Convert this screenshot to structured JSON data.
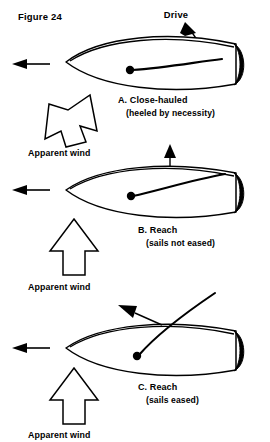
{
  "figure": {
    "caption": "Figure 24",
    "drive_label": "Drive",
    "wind_label": "Apparent wind"
  },
  "colors": {
    "ink": "#000000",
    "paper": "#ffffff",
    "text": "#1a1a1a"
  },
  "panels": [
    {
      "id": "A",
      "title": "A. Close-hauled",
      "subtitle": "(heeled by necessity)",
      "wind_label": "Apparent wind",
      "wind_arrow": "block-arrow-tilted-up-right",
      "force_label": "Drive",
      "travel_arrow": "arrow-left",
      "sail_state": "sheeted-in-flat"
    },
    {
      "id": "B",
      "title": "B. Reach",
      "subtitle": "(sails not eased)",
      "wind_label": "Apparent wind",
      "wind_arrow": "block-arrow-up",
      "force_label": "",
      "travel_arrow": "arrow-left",
      "sail_state": "sheeted-in-not-eased"
    },
    {
      "id": "C",
      "title": "C. Reach",
      "subtitle": "(sails eased)",
      "wind_label": "Apparent wind",
      "wind_arrow": "block-arrow-up",
      "force_label": "",
      "travel_arrow": "arrow-left",
      "sail_state": "eased-boom-out"
    }
  ]
}
